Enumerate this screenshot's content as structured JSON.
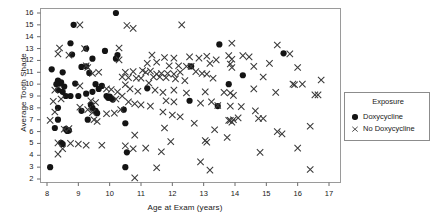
{
  "chart_data": {
    "type": "scatter",
    "title": "",
    "xlabel": "Age at Exam (years)",
    "ylabel": "Average Tooth Shade",
    "xlim": [
      7.6,
      17.4
    ],
    "ylim": [
      1.6,
      16.4
    ],
    "xticks": [
      8,
      9,
      10,
      11,
      12,
      13,
      14,
      15,
      16,
      17
    ],
    "yticks": [
      2,
      3,
      4,
      5,
      6,
      7,
      8,
      9,
      10,
      11,
      12,
      13,
      14,
      15,
      16
    ],
    "grid": false,
    "legend_position": "right",
    "legend_title": "Exposure",
    "frame": true,
    "series": [
      {
        "name": "Doxycycline",
        "marker": "filled-circle",
        "color": "#141414",
        "points": [
          [
            10.2,
            16.0
          ],
          [
            8.85,
            15.0
          ],
          [
            8.75,
            13.45
          ],
          [
            9.25,
            13.0
          ],
          [
            9.85,
            12.8
          ],
          [
            10.25,
            12.45
          ],
          [
            10.2,
            12.15
          ],
          [
            8.8,
            12.5
          ],
          [
            9.45,
            12.15
          ],
          [
            13.5,
            13.35
          ],
          [
            15.55,
            12.6
          ],
          [
            9.1,
            11.45
          ],
          [
            9.25,
            11.5
          ],
          [
            9.35,
            10.95
          ],
          [
            8.15,
            11.25
          ],
          [
            8.5,
            11.0
          ],
          [
            12.6,
            11.5
          ],
          [
            14.25,
            10.75
          ],
          [
            8.35,
            10.3
          ],
          [
            8.4,
            10.05
          ],
          [
            8.45,
            10.15
          ],
          [
            8.3,
            10.0
          ],
          [
            8.55,
            9.8
          ],
          [
            8.9,
            10.05
          ],
          [
            9.55,
            10.0
          ],
          [
            9.75,
            9.85
          ],
          [
            9.65,
            9.6
          ],
          [
            11.2,
            9.65
          ],
          [
            13.8,
            10.0
          ],
          [
            8.35,
            9.5
          ],
          [
            8.5,
            9.35
          ],
          [
            8.6,
            9.0
          ],
          [
            8.75,
            9.0
          ],
          [
            9.0,
            9.0
          ],
          [
            9.25,
            9.2
          ],
          [
            9.45,
            9.35
          ],
          [
            9.9,
            9.0
          ],
          [
            9.95,
            8.85
          ],
          [
            10.05,
            8.8
          ],
          [
            10.1,
            8.7
          ],
          [
            10.0,
            8.95
          ],
          [
            12.55,
            8.6
          ],
          [
            13.45,
            8.15
          ],
          [
            9.4,
            8.25
          ],
          [
            9.45,
            8.0
          ],
          [
            8.35,
            8.0
          ],
          [
            9.1,
            7.75
          ],
          [
            9.55,
            7.75
          ],
          [
            9.6,
            7.55
          ],
          [
            10.45,
            7.85
          ],
          [
            9.3,
            7.0
          ],
          [
            8.35,
            7.0
          ],
          [
            10.5,
            6.7
          ],
          [
            8.25,
            6.3
          ],
          [
            8.6,
            6.2
          ],
          [
            8.7,
            6.1
          ],
          [
            8.65,
            6.05
          ],
          [
            8.45,
            5.05
          ],
          [
            8.5,
            4.95
          ],
          [
            10.55,
            4.25
          ],
          [
            10.5,
            3.0
          ],
          [
            8.1,
            3.0
          ]
        ]
      },
      {
        "name": "No Doxycycline",
        "marker": "x",
        "color": "#3a3a3a",
        "points": [
          [
            9.05,
            15.0
          ],
          [
            12.3,
            15.0
          ],
          [
            10.55,
            14.95
          ],
          [
            10.75,
            14.7
          ],
          [
            8.4,
            13.05
          ],
          [
            9.2,
            13.0
          ],
          [
            10.3,
            13.05
          ],
          [
            13.9,
            13.45
          ],
          [
            15.35,
            13.3
          ],
          [
            8.35,
            12.55
          ],
          [
            8.7,
            12.45
          ],
          [
            10.3,
            12.05
          ],
          [
            11.35,
            12.45
          ],
          [
            11.75,
            12.25
          ],
          [
            12.05,
            12.2
          ],
          [
            12.55,
            12.3
          ],
          [
            12.85,
            12.2
          ],
          [
            13.1,
            12.35
          ],
          [
            13.4,
            12.05
          ],
          [
            13.8,
            12.4
          ],
          [
            13.9,
            12.1
          ],
          [
            14.25,
            12.4
          ],
          [
            14.45,
            12.3
          ],
          [
            15.75,
            12.55
          ],
          [
            11.2,
            11.75
          ],
          [
            11.5,
            11.85
          ],
          [
            11.9,
            11.55
          ],
          [
            12.2,
            11.55
          ],
          [
            12.45,
            11.5
          ],
          [
            12.6,
            11.5
          ],
          [
            13.2,
            11.75
          ],
          [
            13.85,
            11.7
          ],
          [
            13.9,
            11.4
          ],
          [
            9.25,
            11.55
          ],
          [
            9.3,
            11.4
          ],
          [
            9.65,
            11.0
          ],
          [
            9.45,
            10.9
          ],
          [
            10.5,
            11.0
          ],
          [
            10.75,
            11.05
          ],
          [
            11.05,
            11.15
          ],
          [
            11.15,
            11.0
          ],
          [
            11.3,
            11.1
          ],
          [
            11.5,
            10.85
          ],
          [
            11.65,
            10.9
          ],
          [
            11.85,
            10.9
          ],
          [
            12.05,
            10.85
          ],
          [
            12.25,
            11.0
          ],
          [
            12.75,
            11.05
          ],
          [
            12.95,
            10.9
          ],
          [
            13.1,
            10.85
          ],
          [
            14.6,
            11.5
          ],
          [
            15.1,
            11.75
          ],
          [
            16.0,
            11.4
          ],
          [
            10.4,
            10.6
          ],
          [
            10.6,
            10.55
          ],
          [
            10.85,
            10.5
          ],
          [
            11.0,
            10.5
          ],
          [
            11.4,
            10.6
          ],
          [
            11.6,
            10.6
          ],
          [
            11.8,
            10.55
          ],
          [
            12.1,
            10.45
          ],
          [
            12.4,
            10.3
          ],
          [
            13.3,
            10.5
          ],
          [
            14.6,
            9.6
          ],
          [
            14.9,
            10.6
          ],
          [
            15.9,
            9.95
          ],
          [
            16.15,
            10.0
          ],
          [
            16.75,
            10.35
          ],
          [
            8.25,
            9.5
          ],
          [
            9.05,
            9.85
          ],
          [
            9.9,
            9.6
          ],
          [
            10.05,
            9.55
          ],
          [
            10.25,
            9.35
          ],
          [
            10.5,
            9.95
          ],
          [
            10.65,
            9.6
          ],
          [
            10.9,
            9.4
          ],
          [
            11.25,
            10.1
          ],
          [
            11.45,
            9.5
          ],
          [
            11.7,
            9.3
          ],
          [
            12.05,
            9.5
          ],
          [
            12.45,
            9.25
          ],
          [
            13.05,
            9.35
          ],
          [
            13.65,
            9.3
          ],
          [
            13.85,
            9.25
          ],
          [
            13.95,
            9.05
          ],
          [
            15.3,
            9.3
          ],
          [
            15.85,
            10.0
          ],
          [
            16.55,
            9.1
          ],
          [
            16.65,
            9.1
          ],
          [
            8.2,
            8.55
          ],
          [
            8.45,
            8.75
          ],
          [
            9.4,
            8.6
          ],
          [
            9.55,
            8.45
          ],
          [
            10.2,
            8.75
          ],
          [
            10.4,
            9.0
          ],
          [
            10.6,
            8.5
          ],
          [
            10.8,
            8.35
          ],
          [
            11.0,
            8.25
          ],
          [
            11.3,
            8.15
          ],
          [
            11.8,
            8.6
          ],
          [
            12.05,
            8.5
          ],
          [
            12.9,
            8.4
          ],
          [
            13.25,
            8.5
          ],
          [
            13.45,
            8.2
          ],
          [
            13.85,
            8.15
          ],
          [
            14.2,
            8.1
          ],
          [
            14.65,
            7.75
          ],
          [
            8.25,
            7.65
          ],
          [
            9.05,
            8.05
          ],
          [
            9.3,
            7.85
          ],
          [
            9.45,
            7.6
          ],
          [
            9.9,
            7.5
          ],
          [
            10.15,
            7.55
          ],
          [
            10.35,
            7.85
          ],
          [
            11.7,
            7.65
          ],
          [
            12.0,
            7.4
          ],
          [
            12.25,
            7.25
          ],
          [
            13.8,
            6.95
          ],
          [
            13.95,
            7.0
          ],
          [
            14.1,
            7.15
          ],
          [
            14.75,
            7.1
          ],
          [
            14.9,
            7.1
          ],
          [
            8.1,
            6.95
          ],
          [
            9.5,
            7.0
          ],
          [
            9.6,
            6.85
          ],
          [
            12.7,
            6.7
          ],
          [
            13.85,
            6.95
          ],
          [
            13.9,
            6.8
          ],
          [
            16.4,
            6.45
          ],
          [
            8.55,
            6.2
          ],
          [
            8.7,
            6.25
          ],
          [
            11.75,
            6.3
          ],
          [
            13.35,
            6.15
          ],
          [
            15.35,
            6.0
          ],
          [
            15.5,
            5.8
          ],
          [
            8.35,
            5.05
          ],
          [
            8.75,
            5.0
          ],
          [
            9.0,
            4.95
          ],
          [
            9.25,
            4.85
          ],
          [
            9.75,
            4.85
          ],
          [
            10.5,
            4.8
          ],
          [
            11.95,
            5.15
          ],
          [
            13.05,
            5.25
          ],
          [
            13.1,
            5.1
          ],
          [
            13.75,
            5.5
          ],
          [
            8.5,
            4.55
          ],
          [
            8.35,
            4.1
          ],
          [
            10.8,
            5.7
          ],
          [
            10.75,
            4.55
          ],
          [
            11.15,
            4.6
          ],
          [
            11.65,
            4.3
          ],
          [
            14.8,
            4.25
          ],
          [
            16.0,
            4.6
          ],
          [
            12.9,
            3.45
          ],
          [
            13.2,
            2.75
          ],
          [
            11.5,
            2.95
          ],
          [
            16.4,
            2.8
          ],
          [
            10.8,
            2.1
          ]
        ]
      }
    ]
  },
  "legend": {
    "title": "Exposure",
    "entries": [
      {
        "label": "Doxycycline",
        "marker": "filled-circle"
      },
      {
        "label": "No Doxycycline",
        "marker": "x"
      }
    ]
  }
}
